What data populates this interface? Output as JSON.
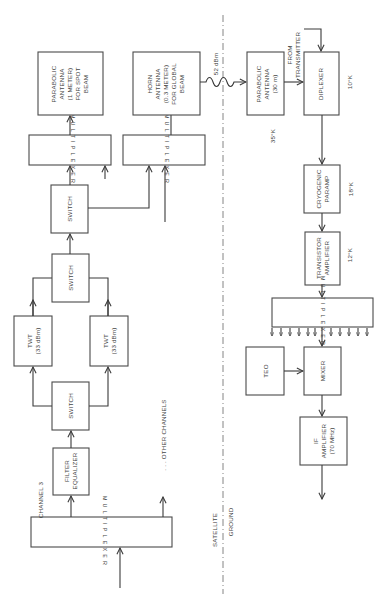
{
  "diagram": {
    "orientation": "rotated-90-ccw",
    "divider": {
      "top_label": "SATELLITE",
      "bottom_label": "GROUND"
    },
    "satellite": {
      "input_label": "CHANNEL 3",
      "other_channels": ". . . OTHER CHANNELS",
      "blocks": {
        "mux_in": "MULTIPLEXER",
        "filter": [
          "FILTER",
          "EQUALIZER"
        ],
        "switch_lower": "SWITCH",
        "twt_left": [
          "TWT",
          "(33 dBm)"
        ],
        "twt_right": [
          "TWT",
          "(33 dBm)"
        ],
        "switch_mid": "SWITCH",
        "switch_top": "SWITCH",
        "mux_spot": "MULTIPLEXER",
        "mux_global": "MULTIPLEXER",
        "spot_antenna": [
          "PARABOLIC",
          "ANTENNA",
          "(1 METER)",
          "FOR SPOT",
          "BEAM"
        ],
        "horn_antenna": [
          "HORN",
          "ANTENNA",
          "(0.3 METER)",
          "FOR GLOBAL",
          "BEAM"
        ]
      },
      "link_power": "52 dBm"
    },
    "ground": {
      "from_transmitter": [
        "FROM",
        "TRANSMITTER"
      ],
      "blocks": {
        "ground_antenna": [
          "PARABOLIC",
          "ANTENNA",
          "(30 m)"
        ],
        "diplexer": "DIPLEXER",
        "paramp": [
          "CRYOGENIC",
          "PARAMP"
        ],
        "transistor_amp": [
          "TRANSISTOR",
          "AMPLIFIER"
        ],
        "mux_ground": "MULTIPLEXER",
        "teo": "TEO",
        "mixer": "MIXER",
        "if_amp": [
          "IF",
          "AMPLIFIER",
          "(70 MHz)"
        ]
      },
      "temperatures": {
        "antenna": "35°K",
        "diplexer": "10°K",
        "paramp": "18°K",
        "transistor_amp": "12°K"
      }
    }
  }
}
